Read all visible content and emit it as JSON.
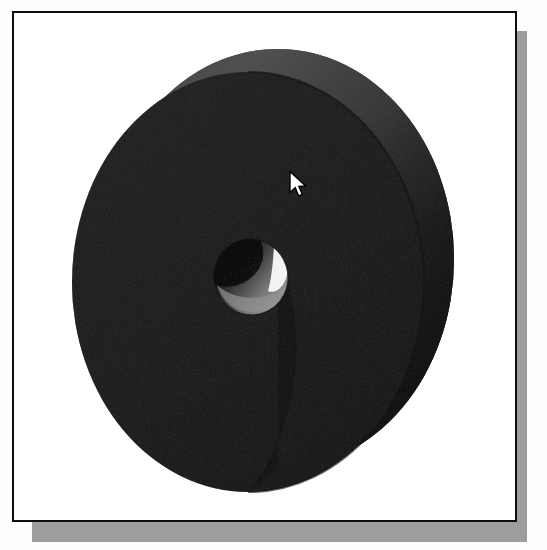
{
  "window": {
    "title": "3D Model Viewport",
    "background_color": "#ffffff",
    "border_color": "#0d0d0d",
    "shadow_color": "#9d9d9d"
  },
  "viewport": {
    "name": "model-viewport",
    "background_color": "#ffffff",
    "frame": {
      "x": 12,
      "y": 11,
      "width": 505,
      "height": 511
    },
    "shadow_offset": {
      "x": 20,
      "y": 20
    }
  },
  "model": {
    "name": "disc-with-center-bore",
    "shape": "cylindrical disc / washer",
    "front_face_color": "#575757",
    "rim_light_color": "#8b8b8b",
    "rim_dark_color": "#474747",
    "edge_line_color": "#3a3a3a",
    "bore": {
      "name": "center-bore",
      "inner_wall_dark_color": "#3c3c3c",
      "inner_wall_light_color": "#b9b9b9",
      "highlight_color": "#fdfdfd"
    },
    "geometry": {
      "front_face_center": {
        "x": 246,
        "y": 280
      },
      "front_face_rx": 176,
      "front_face_ry": 210,
      "back_face_center": {
        "x": 276,
        "y": 258
      },
      "back_face_rx": 176,
      "back_face_ry": 210,
      "bore_center": {
        "x": 249,
        "y": 275
      },
      "bore_rx": 36,
      "bore_ry": 37
    }
  },
  "cursor": {
    "name": "mouse-pointer",
    "type": "arrow",
    "position": {
      "x": 276,
      "y": 159
    },
    "fill_color": "#ffffff",
    "outline_color": "#000000"
  }
}
